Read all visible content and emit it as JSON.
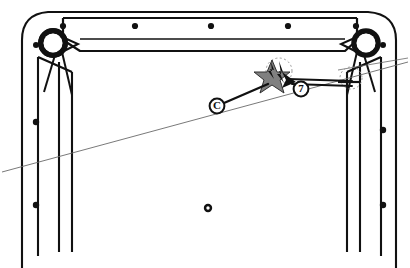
{
  "diagram": {
    "background_color": "#ffffff",
    "line_color": "#111111",
    "thin_line_color": "#5a5a5a",
    "damage_fill_color": "#808080",
    "dashed_outline_color": "#9a9a9a",
    "canvas": {
      "width": 410,
      "height": 268
    }
  },
  "callouts": [
    {
      "id": "callout-c",
      "label": "C",
      "shape": "circled-letter",
      "x": 217,
      "y": 106,
      "radius": 7,
      "leader_to": {
        "x": 268,
        "y": 82
      }
    },
    {
      "id": "callout-7",
      "label": "7",
      "shape": "circled-number",
      "x": 301,
      "y": 89,
      "radius": 7,
      "leader_to": {
        "x": 283,
        "y": 80
      }
    }
  ],
  "markers": {
    "damage_star": {
      "name": "damage-burst",
      "center_x": 272,
      "center_y": 78,
      "fill": "#808080",
      "outline": "#1a1a1a"
    },
    "center_grommet": {
      "name": "center-grommet",
      "x": 208,
      "y": 208,
      "outer_radius": 4,
      "inner_radius": 1.6
    },
    "selection_dashed_left": {
      "x": 278,
      "y": 70,
      "rx": 13,
      "ry": 13
    },
    "selection_dashed_right": {
      "x": 351,
      "y": 78,
      "rx": 11,
      "ry": 11
    }
  },
  "corner_rollers": [
    {
      "name": "roller-top-left",
      "cx": 53,
      "cy": 43,
      "r_outer": 14,
      "r_inner": 10
    },
    {
      "name": "roller-top-right",
      "cx": 366,
      "cy": 43,
      "r_outer": 14,
      "r_inner": 10
    }
  ],
  "rivets": {
    "top_rail": [
      {
        "x": 135,
        "y": 26
      },
      {
        "x": 211,
        "y": 26
      },
      {
        "x": 288,
        "y": 26
      },
      {
        "x": 66,
        "y": 25
      },
      {
        "x": 355,
        "y": 25
      }
    ],
    "left_rail": [
      {
        "x": 31,
        "y": 122
      },
      {
        "x": 31,
        "y": 205
      },
      {
        "x": 30,
        "y": 46
      }
    ],
    "right_rail": [
      {
        "x": 383,
        "y": 130
      },
      {
        "x": 383,
        "y": 205
      }
    ]
  },
  "structure": {
    "outer_frame": "rounded-corner outer shell",
    "top_rail": "horizontal header beam with rivet row",
    "left_rail": "vertical left stile, triple line",
    "right_rail": "vertical right stile, triple line",
    "sight_line": "thin diagonal perspective line crossing the view"
  }
}
